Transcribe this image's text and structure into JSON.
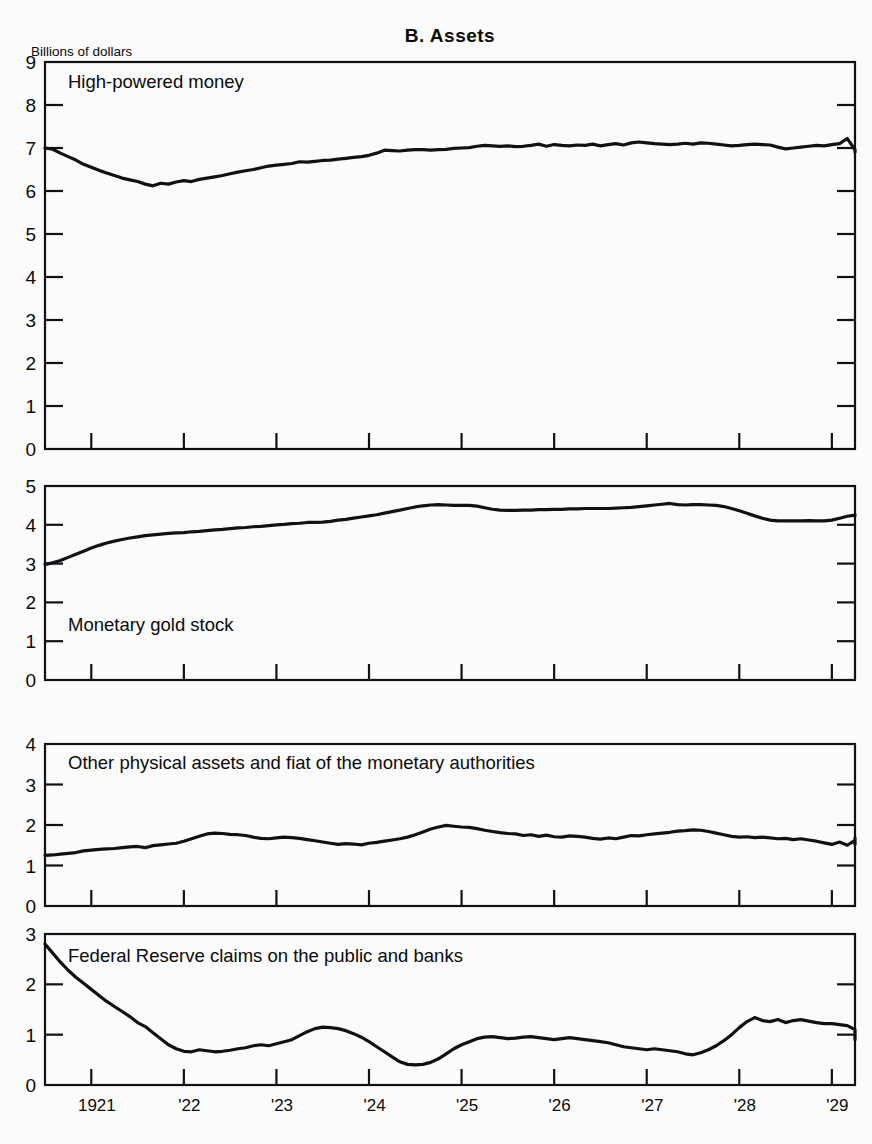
{
  "title": "B.  Assets",
  "unit_label": "Billions of dollars",
  "ghost_header": "",
  "x_axis": {
    "labels": [
      "1921",
      "'22",
      "'23",
      "'24",
      "'25",
      "'26",
      "'27",
      "'28",
      "'29"
    ],
    "range": [
      1921.0,
      1929.75
    ],
    "tick_years": [
      1921.5,
      1922.5,
      1923.5,
      1924.5,
      1925.5,
      1926.5,
      1927.5,
      1928.5,
      1929.5
    ]
  },
  "panels": [
    {
      "name": "high-powered-money",
      "series_label": "High-powered money",
      "y_ticks": [
        0,
        1,
        2,
        3,
        4,
        5,
        6,
        7,
        8,
        9
      ],
      "ylim": [
        0,
        9
      ]
    },
    {
      "name": "monetary-gold-stock",
      "series_label": "Monetary gold stock",
      "y_ticks": [
        0,
        1,
        2,
        3,
        4,
        5
      ],
      "ylim": [
        0,
        5
      ]
    },
    {
      "name": "other-physical-assets",
      "series_label": "Other physical assets and fiat of the monetary authorities",
      "y_ticks": [
        0,
        1,
        2,
        3,
        4
      ],
      "ylim": [
        0,
        4
      ]
    },
    {
      "name": "federal-reserve-claims",
      "series_label": "Federal Reserve claims on the public and banks",
      "y_ticks": [
        0,
        1,
        2,
        3
      ],
      "ylim": [
        0,
        3
      ]
    }
  ],
  "chart_data": {
    "type": "line",
    "title": "B.  Assets",
    "xlabel": "",
    "ylabel": "Billions of dollars",
    "grid": false,
    "legend": "inline-labels",
    "x_start": 1921.0,
    "x_step": 0.0833333,
    "panels": [
      {
        "id": "high-powered-money",
        "title": "High-powered money",
        "ylim": [
          0,
          9
        ],
        "yticks": [
          0,
          1,
          2,
          3,
          4,
          5,
          6,
          7,
          8,
          9
        ],
        "values": [
          7.0,
          6.97,
          6.88,
          6.8,
          6.72,
          6.62,
          6.55,
          6.48,
          6.42,
          6.36,
          6.3,
          6.26,
          6.22,
          6.16,
          6.12,
          6.18,
          6.16,
          6.21,
          6.24,
          6.22,
          6.27,
          6.3,
          6.33,
          6.36,
          6.4,
          6.44,
          6.47,
          6.5,
          6.54,
          6.58,
          6.6,
          6.62,
          6.64,
          6.68,
          6.67,
          6.69,
          6.71,
          6.72,
          6.74,
          6.76,
          6.78,
          6.8,
          6.83,
          6.88,
          6.95,
          6.94,
          6.93,
          6.95,
          6.96,
          6.96,
          6.95,
          6.96,
          6.97,
          6.99,
          7.0,
          7.01,
          7.04,
          7.06,
          7.05,
          7.04,
          7.05,
          7.03,
          7.04,
          7.06,
          7.09,
          7.04,
          7.08,
          7.06,
          7.05,
          7.07,
          7.06,
          7.09,
          7.05,
          7.08,
          7.1,
          7.07,
          7.12,
          7.14,
          7.12,
          7.1,
          7.09,
          7.08,
          7.09,
          7.11,
          7.09,
          7.12,
          7.11,
          7.09,
          7.07,
          7.05,
          7.06,
          7.08,
          7.09,
          7.08,
          7.07,
          7.02,
          6.98,
          7.0,
          7.02,
          7.04,
          7.06,
          7.05,
          7.08,
          7.1,
          7.22,
          6.96,
          6.92,
          6.9
        ]
      },
      {
        "id": "monetary-gold-stock",
        "title": "Monetary gold stock",
        "ylim": [
          0,
          5
        ],
        "yticks": [
          0,
          1,
          2,
          3,
          4,
          5
        ],
        "values": [
          2.98,
          3.02,
          3.08,
          3.16,
          3.24,
          3.32,
          3.4,
          3.47,
          3.53,
          3.58,
          3.62,
          3.66,
          3.69,
          3.72,
          3.74,
          3.76,
          3.78,
          3.79,
          3.8,
          3.82,
          3.83,
          3.85,
          3.87,
          3.88,
          3.9,
          3.92,
          3.93,
          3.95,
          3.96,
          3.98,
          4.0,
          4.01,
          4.03,
          4.04,
          4.06,
          4.06,
          4.07,
          4.09,
          4.12,
          4.14,
          4.17,
          4.2,
          4.23,
          4.26,
          4.3,
          4.34,
          4.38,
          4.42,
          4.46,
          4.49,
          4.51,
          4.52,
          4.51,
          4.5,
          4.5,
          4.5,
          4.48,
          4.44,
          4.4,
          4.38,
          4.37,
          4.37,
          4.38,
          4.38,
          4.39,
          4.39,
          4.4,
          4.4,
          4.41,
          4.41,
          4.42,
          4.42,
          4.42,
          4.42,
          4.43,
          4.44,
          4.45,
          4.47,
          4.49,
          4.51,
          4.53,
          4.55,
          4.52,
          4.51,
          4.52,
          4.52,
          4.51,
          4.5,
          4.47,
          4.42,
          4.36,
          4.3,
          4.23,
          4.17,
          4.12,
          4.1,
          4.1,
          4.1,
          4.1,
          4.11,
          4.1,
          4.1,
          4.12,
          4.17,
          4.22,
          4.25,
          4.26,
          4.24
        ]
      },
      {
        "id": "other-physical-assets",
        "title": "Other physical assets and fiat of the monetary authorities",
        "ylim": [
          0,
          4
        ],
        "yticks": [
          0,
          1,
          2,
          3,
          4
        ],
        "values": [
          1.25,
          1.26,
          1.28,
          1.3,
          1.32,
          1.36,
          1.38,
          1.4,
          1.41,
          1.42,
          1.44,
          1.46,
          1.47,
          1.44,
          1.49,
          1.51,
          1.53,
          1.55,
          1.6,
          1.66,
          1.72,
          1.78,
          1.8,
          1.79,
          1.77,
          1.76,
          1.74,
          1.7,
          1.67,
          1.66,
          1.68,
          1.7,
          1.69,
          1.67,
          1.64,
          1.61,
          1.58,
          1.55,
          1.52,
          1.54,
          1.53,
          1.51,
          1.55,
          1.57,
          1.6,
          1.63,
          1.66,
          1.7,
          1.76,
          1.83,
          1.9,
          1.95,
          1.99,
          1.97,
          1.95,
          1.94,
          1.91,
          1.87,
          1.84,
          1.81,
          1.79,
          1.78,
          1.74,
          1.76,
          1.72,
          1.75,
          1.71,
          1.7,
          1.73,
          1.72,
          1.7,
          1.67,
          1.65,
          1.68,
          1.66,
          1.7,
          1.74,
          1.73,
          1.76,
          1.78,
          1.8,
          1.82,
          1.85,
          1.86,
          1.88,
          1.87,
          1.84,
          1.8,
          1.76,
          1.72,
          1.7,
          1.71,
          1.69,
          1.7,
          1.68,
          1.66,
          1.67,
          1.64,
          1.66,
          1.63,
          1.6,
          1.56,
          1.52,
          1.58,
          1.5,
          1.62,
          1.52,
          1.68
        ]
      },
      {
        "id": "federal-reserve-claims",
        "title": "Federal Reserve claims on the public and banks",
        "ylim": [
          0,
          3
        ],
        "yticks": [
          0,
          1,
          2,
          3
        ],
        "values": [
          2.8,
          2.62,
          2.44,
          2.28,
          2.14,
          2.02,
          1.9,
          1.78,
          1.66,
          1.56,
          1.46,
          1.36,
          1.24,
          1.16,
          1.04,
          0.92,
          0.8,
          0.72,
          0.67,
          0.66,
          0.7,
          0.68,
          0.66,
          0.67,
          0.69,
          0.72,
          0.74,
          0.78,
          0.8,
          0.78,
          0.82,
          0.86,
          0.9,
          0.98,
          1.06,
          1.12,
          1.15,
          1.14,
          1.12,
          1.08,
          1.02,
          0.95,
          0.86,
          0.76,
          0.66,
          0.56,
          0.46,
          0.41,
          0.4,
          0.41,
          0.45,
          0.52,
          0.62,
          0.72,
          0.8,
          0.86,
          0.92,
          0.95,
          0.96,
          0.94,
          0.92,
          0.93,
          0.95,
          0.96,
          0.94,
          0.92,
          0.9,
          0.92,
          0.94,
          0.92,
          0.9,
          0.88,
          0.86,
          0.84,
          0.8,
          0.76,
          0.74,
          0.72,
          0.7,
          0.72,
          0.7,
          0.68,
          0.66,
          0.62,
          0.6,
          0.64,
          0.7,
          0.78,
          0.88,
          1.0,
          1.14,
          1.26,
          1.34,
          1.28,
          1.26,
          1.3,
          1.24,
          1.28,
          1.3,
          1.27,
          1.24,
          1.22,
          1.22,
          1.2,
          1.18,
          1.1,
          0.98,
          0.9
        ]
      }
    ]
  }
}
